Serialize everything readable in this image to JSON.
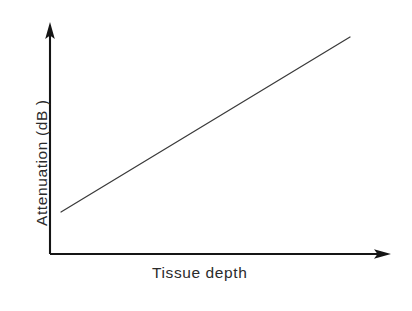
{
  "figure": {
    "width": 412,
    "height": 311,
    "background_color": "#ffffff",
    "axis_color": "#151515",
    "data_line_color": "#3a3a3a",
    "text_color": "#2b2b2b"
  },
  "labels": {
    "y_axis": "Attenuation (dB )",
    "x_axis": "Tissue depth"
  },
  "chart_data": {
    "type": "line",
    "title": "",
    "subtitle": "",
    "xlabel": "Tissue depth",
    "ylabel": "Attenuation (dB )",
    "grid": false,
    "legend": null,
    "xlim": [
      0,
      1
    ],
    "ylim": [
      0,
      1
    ],
    "x_tick_labels": [],
    "y_tick_labels": [],
    "annotations": [],
    "axes": {
      "x_axis_arrow": true,
      "y_axis_arrow": true,
      "origin_px": [
        50,
        254
      ],
      "x_axis_end_px": [
        391,
        254
      ],
      "y_axis_end_px": [
        50,
        22
      ]
    },
    "series": [
      {
        "name": "Attenuation",
        "x": [
          0.032,
          1.0
        ],
        "y": [
          0.181,
          0.935
        ],
        "x_px": [
          61,
          350
        ],
        "y_px": [
          212,
          37
        ],
        "style": "solid"
      }
    ]
  }
}
